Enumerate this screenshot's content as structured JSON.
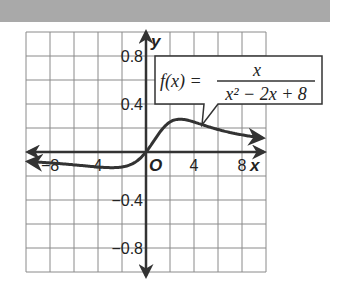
{
  "header": {
    "color": "#a9a9a9"
  },
  "chart_data": {
    "type": "line",
    "title": "",
    "function_label": {
      "lhs": "f(x) =",
      "numerator": "x",
      "denominator": "x² − 2x + 8"
    },
    "xlabel": "x",
    "ylabel": "y",
    "origin_label": "O",
    "xlim": [
      -10,
      10
    ],
    "ylim": [
      -1.0,
      1.0
    ],
    "x_grid_step": 2,
    "y_grid_step": 0.2,
    "grid": true,
    "x_ticks": [
      {
        "value": -8,
        "label": "−8"
      },
      {
        "value": -4,
        "label": "4"
      },
      {
        "value": 4,
        "label": "4"
      },
      {
        "value": 8,
        "label": "8"
      }
    ],
    "y_ticks": [
      {
        "value": 0.8,
        "label": "0.8"
      },
      {
        "value": 0.4,
        "label": "0.4"
      },
      {
        "value": -0.4,
        "label": "−0.4"
      },
      {
        "value": -0.8,
        "label": "−0.8"
      }
    ],
    "series": [
      {
        "name": "f(x) = x / (x^2 - 2x + 8)",
        "x": [
          -9.8,
          -8,
          -6,
          -4,
          -2,
          -1,
          0,
          1,
          2,
          2.83,
          4,
          6,
          8,
          9.7
        ],
        "values": [
          -0.079,
          -0.091,
          -0.107,
          -0.125,
          -0.125,
          -0.091,
          0,
          0.143,
          0.25,
          0.274,
          0.25,
          0.188,
          0.143,
          0.117
        ]
      }
    ],
    "line_color": "#333333"
  }
}
